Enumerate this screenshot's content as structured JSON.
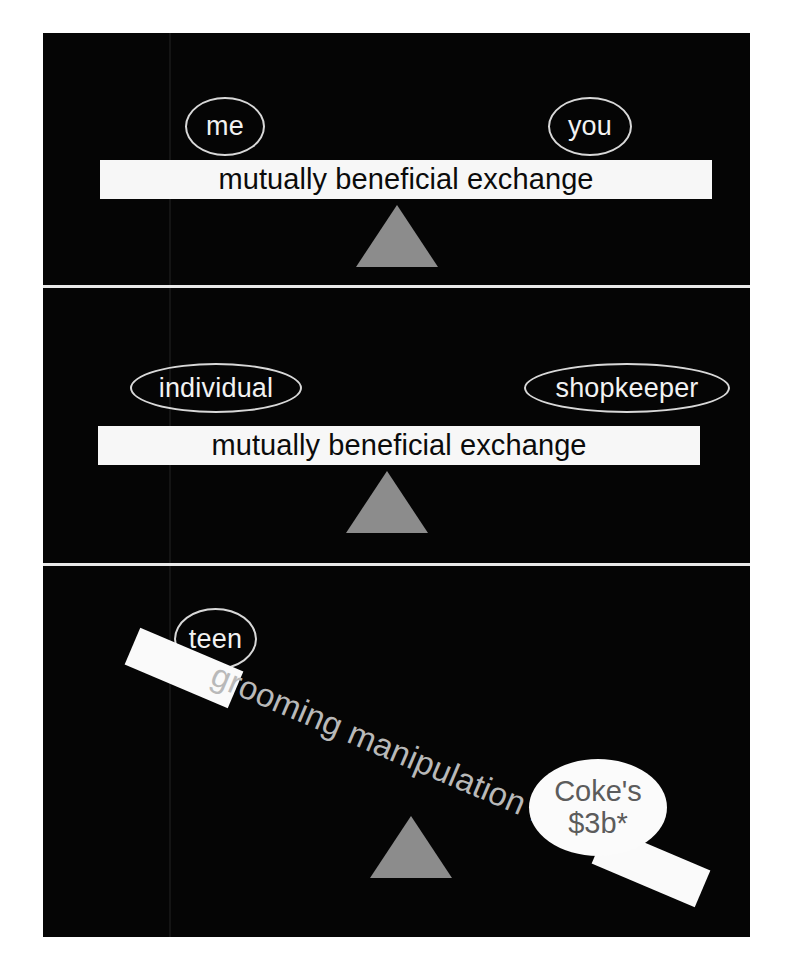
{
  "figure": {
    "background_color": "#050505",
    "accent_gray": "#8c8c8c",
    "beam_color": "#f7f7f7",
    "caption_gray": "#b9b9b9"
  },
  "panels": [
    {
      "id": "panel-1",
      "state": "balanced",
      "left_label": "me",
      "right_label": "you",
      "beam_label": "mutually beneficial exchange"
    },
    {
      "id": "panel-2",
      "state": "balanced",
      "left_label": "individual",
      "right_label": "shopkeeper",
      "beam_label": "mutually beneficial exchange"
    },
    {
      "id": "panel-3",
      "state": "tipped",
      "left_label": "teen",
      "right_label_line_1": "Coke's",
      "right_label_line_2": "$3b*",
      "beam_label": "grooming manipulation harm"
    }
  ],
  "chart_data": {
    "type": "diagram",
    "panels": [
      {
        "index": 1,
        "kind": "balance-scale",
        "tilt_degrees": 0,
        "left_side": "me",
        "right_side": "you",
        "beam_text": "mutually beneficial exchange",
        "fulcrum": "centered"
      },
      {
        "index": 2,
        "kind": "balance-scale",
        "tilt_degrees": 0,
        "left_side": "individual",
        "right_side": "shopkeeper",
        "beam_text": "mutually beneficial exchange",
        "fulcrum": "centered"
      },
      {
        "index": 3,
        "kind": "balance-scale",
        "tilt_degrees": 23,
        "left_side": "teen",
        "right_side": "Coke's $3b*",
        "beam_text": "grooming manipulation harm",
        "fulcrum": "centered",
        "note": "right side weighted down"
      }
    ]
  }
}
